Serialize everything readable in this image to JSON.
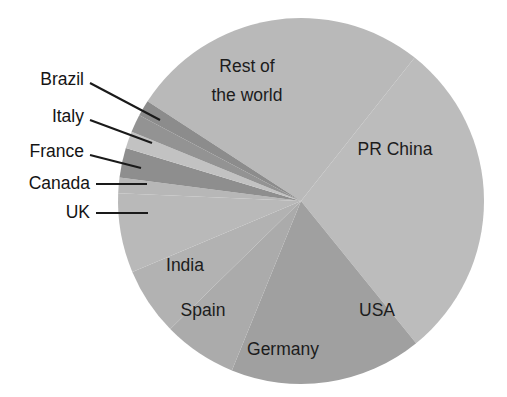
{
  "chart_data": {
    "type": "pie",
    "title": "",
    "subtitle": "",
    "xlabel": "",
    "ylabel": "",
    "legend_position": "none",
    "grid": false,
    "labels_inside": [
      "Rest of the world",
      "PR China",
      "USA",
      "Germany",
      "Spain",
      "India"
    ],
    "labels_callout": [
      "UK",
      "Canada",
      "France",
      "Italy",
      "Brazil"
    ],
    "categories": [
      "Rest of the world",
      "PR China",
      "USA",
      "Germany",
      "Spain",
      "India",
      "UK",
      "Canada",
      "France",
      "Italy",
      "Brazil"
    ],
    "values": [
      26.5,
      28.5,
      17.0,
      6.5,
      6.0,
      7.0,
      1.4,
      2.6,
      1.5,
      1.6,
      1.4
    ],
    "units": "percent",
    "start_angle_deg": -57,
    "direction": "clockwise",
    "slice_colors": [
      "#b9b9b9",
      "#bcbcbc",
      "#a0a0a0",
      "#ababab",
      "#b2b2b2",
      "#b9b9b9",
      "#b7b7b7",
      "#8e8e8e",
      "#c2c2c2",
      "#939393",
      "#8c8c8c"
    ]
  },
  "geometry": {
    "center_x": 301,
    "center_y": 201,
    "radius": 183
  },
  "colors": {
    "background": "#ffffff",
    "text": "#1a1a1a",
    "leader_line": "#1a1a1a",
    "light_gray": "#b9b9b9",
    "mid_gray": "#a8a8a8",
    "dark_gray": "#8e8e8e"
  },
  "slices": [
    {
      "id": "rest-of-the-world",
      "label": "Rest of the world",
      "label_line_1": "Rest of",
      "label_line_2": "the world",
      "value": 26.5,
      "color": "#b9b9b9",
      "start_deg": -57.0,
      "end_deg": 38.4,
      "label_x": 247,
      "label_y": 67,
      "label_y2": 96,
      "label_mode": "inside-two-line"
    },
    {
      "id": "pr-china",
      "label": "PR China",
      "value": 28.5,
      "color": "#bcbcbc",
      "start_deg": 38.4,
      "end_deg": 141.0,
      "label_x": 395,
      "label_y": 150,
      "label_mode": "inside"
    },
    {
      "id": "usa",
      "label": "USA",
      "value": 17.0,
      "color": "#a0a0a0",
      "start_deg": 141.0,
      "end_deg": 202.2,
      "label_x": 377,
      "label_y": 311,
      "label_mode": "inside"
    },
    {
      "id": "germany",
      "label": "Germany",
      "value": 6.5,
      "color": "#ababab",
      "start_deg": 202.2,
      "end_deg": 225.6,
      "label_x": 283,
      "label_y": 350,
      "label_mode": "inside"
    },
    {
      "id": "spain",
      "label": "Spain",
      "value": 6.0,
      "color": "#b2b2b2",
      "start_deg": 225.6,
      "end_deg": 247.2,
      "label_x": 203,
      "label_y": 311,
      "label_mode": "inside"
    },
    {
      "id": "india",
      "label": "India",
      "value": 7.0,
      "color": "#b9b9b9",
      "start_deg": 247.2,
      "end_deg": 272.4,
      "label_x": 185,
      "label_y": 266,
      "label_mode": "inside"
    },
    {
      "id": "uk",
      "label": "UK",
      "value": 1.4,
      "color": "#b7b7b7",
      "start_deg": 272.4,
      "end_deg": 277.4,
      "label_x": 90,
      "label_y": 213,
      "leader_points": "96,213 148,213",
      "label_mode": "callout"
    },
    {
      "id": "canada",
      "label": "Canada",
      "value": 2.6,
      "color": "#8e8e8e",
      "start_deg": 277.4,
      "end_deg": 286.8,
      "label_x": 90,
      "label_y": 184,
      "leader_points": "96,184 147,184",
      "label_mode": "callout"
    },
    {
      "id": "france",
      "label": "France",
      "value": 1.5,
      "color": "#c2c2c2",
      "start_deg": 286.8,
      "end_deg": 292.2,
      "label_x": 84,
      "label_y": 152,
      "leader_points": "90,155 141,168",
      "label_mode": "callout"
    },
    {
      "id": "italy",
      "label": "Italy",
      "value": 1.6,
      "color": "#939393",
      "start_deg": 292.2,
      "end_deg": 297.9,
      "label_x": 84,
      "label_y": 117,
      "leader_points": "90,120 152,143",
      "label_mode": "callout"
    },
    {
      "id": "brazil",
      "label": "Brazil",
      "value": 1.4,
      "color": "#8c8c8c",
      "start_deg": 297.9,
      "end_deg": 303.0,
      "label_x": 84,
      "label_y": 80,
      "leader_points": "90,83 160,120",
      "label_mode": "callout"
    }
  ]
}
